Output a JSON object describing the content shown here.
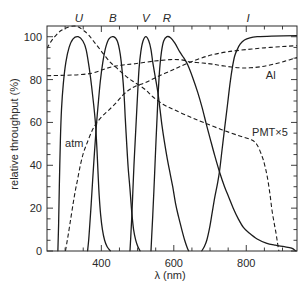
{
  "chart_data": {
    "type": "line",
    "title": "",
    "xlabel": "λ (nm)",
    "ylabel": "relative throughput (%)",
    "xlim": [
      250,
      940
    ],
    "ylim": [
      0,
      105
    ],
    "grid": false,
    "legend": "inline annotations",
    "xticks_major": [
      400,
      600,
      800
    ],
    "xticks_minor": [
      300,
      350,
      450,
      500,
      550,
      650,
      700,
      750,
      850,
      900
    ],
    "yticks_major": [
      0,
      20,
      40,
      60,
      80,
      100
    ],
    "yticks_minor": [
      5,
      10,
      15,
      25,
      30,
      35,
      45,
      50,
      55,
      65,
      70,
      75,
      85,
      90,
      95
    ],
    "band_labels": [
      {
        "label": "U",
        "x": 338
      },
      {
        "label": "B",
        "x": 432
      },
      {
        "label": "V",
        "x": 523
      },
      {
        "label": "R",
        "x": 581
      },
      {
        "label": "I",
        "x": 805
      }
    ],
    "annotations": [
      {
        "text": "atm",
        "x": 300,
        "y": 48.5
      },
      {
        "text": "Al",
        "x": 854,
        "y": 80.3
      },
      {
        "text": "PMT×5",
        "x": 816,
        "y": 53.7
      }
    ],
    "series": [
      {
        "name": "U",
        "style": "solid",
        "points": [
          [
            280,
            0
          ],
          [
            282,
            12
          ],
          [
            284,
            30
          ],
          [
            287,
            52
          ],
          [
            290,
            66
          ],
          [
            295,
            78
          ],
          [
            302,
            88
          ],
          [
            311,
            95
          ],
          [
            322,
            99
          ],
          [
            336,
            100
          ],
          [
            349,
            98
          ],
          [
            358,
            94
          ],
          [
            366,
            86
          ],
          [
            373,
            77
          ],
          [
            379,
            68
          ],
          [
            384,
            59
          ],
          [
            388,
            47
          ],
          [
            391,
            36
          ],
          [
            394,
            26
          ],
          [
            398,
            17
          ],
          [
            403,
            10
          ],
          [
            409,
            5
          ],
          [
            416,
            2
          ],
          [
            425,
            0
          ]
        ]
      },
      {
        "name": "B",
        "style": "solid",
        "points": [
          [
            362,
            0
          ],
          [
            365,
            5
          ],
          [
            368,
            12
          ],
          [
            372,
            22
          ],
          [
            376,
            33
          ],
          [
            381,
            46
          ],
          [
            386,
            58
          ],
          [
            391,
            68
          ],
          [
            397,
            79
          ],
          [
            404,
            88
          ],
          [
            412,
            95
          ],
          [
            421,
            99
          ],
          [
            433,
            100
          ],
          [
            444,
            98
          ],
          [
            452,
            92
          ],
          [
            458,
            83
          ],
          [
            463,
            72
          ],
          [
            466,
            62
          ],
          [
            470,
            50
          ],
          [
            474,
            39
          ],
          [
            479,
            29
          ],
          [
            484,
            18
          ],
          [
            489,
            10
          ],
          [
            495,
            5
          ],
          [
            501,
            2
          ],
          [
            507,
            0
          ]
        ]
      },
      {
        "name": "V",
        "style": "solid",
        "points": [
          [
            479,
            0
          ],
          [
            481,
            6
          ],
          [
            484,
            16
          ],
          [
            487,
            28
          ],
          [
            490,
            40
          ],
          [
            493,
            50
          ],
          [
            496,
            60
          ],
          [
            500,
            73
          ],
          [
            504,
            85
          ],
          [
            509,
            93
          ],
          [
            515,
            98
          ],
          [
            523,
            100
          ],
          [
            531,
            98
          ],
          [
            537,
            94
          ],
          [
            542,
            88
          ],
          [
            549,
            81
          ],
          [
            556,
            74
          ],
          [
            562,
            66
          ],
          [
            567,
            59
          ],
          [
            574,
            51
          ],
          [
            582,
            43
          ],
          [
            590,
            36
          ],
          [
            597,
            30
          ],
          [
            605,
            22
          ],
          [
            613,
            16
          ],
          [
            622,
            10
          ],
          [
            630,
            5
          ],
          [
            636,
            2
          ],
          [
            641,
            0
          ]
        ]
      },
      {
        "name": "R",
        "style": "solid",
        "points": [
          [
            537,
            0
          ],
          [
            539,
            7
          ],
          [
            542,
            17
          ],
          [
            545,
            28
          ],
          [
            548,
            40
          ],
          [
            551,
            52
          ],
          [
            554,
            63
          ],
          [
            557,
            74
          ],
          [
            561,
            85
          ],
          [
            566,
            93
          ],
          [
            572,
            98
          ],
          [
            581,
            100
          ],
          [
            591,
            99.5
          ],
          [
            603,
            97
          ],
          [
            616,
            93
          ],
          [
            628,
            90
          ],
          [
            638,
            87
          ],
          [
            652,
            81
          ],
          [
            666,
            74
          ],
          [
            678,
            67
          ],
          [
            690,
            59
          ],
          [
            701,
            52
          ],
          [
            713,
            44.5
          ],
          [
            726,
            37
          ],
          [
            740,
            30
          ],
          [
            752,
            25
          ],
          [
            764,
            20
          ],
          [
            778,
            15
          ],
          [
            792,
            11
          ],
          [
            808,
            8.4
          ],
          [
            830,
            5.6
          ],
          [
            855,
            3.7
          ],
          [
            880,
            2.7
          ],
          [
            905,
            2
          ],
          [
            925,
            1.3
          ],
          [
            937,
            0
          ]
        ]
      },
      {
        "name": "I",
        "style": "solid",
        "points": [
          [
            677,
            0
          ],
          [
            684,
            2
          ],
          [
            691,
            5
          ],
          [
            699,
            11
          ],
          [
            706,
            18
          ],
          [
            713,
            25
          ],
          [
            720,
            31
          ],
          [
            726,
            37
          ],
          [
            733,
            47
          ],
          [
            740,
            57
          ],
          [
            748,
            68
          ],
          [
            755,
            78
          ],
          [
            762,
            86
          ],
          [
            768,
            91
          ],
          [
            775,
            94
          ],
          [
            783,
            96.5
          ],
          [
            795,
            98.5
          ],
          [
            810,
            99.5
          ],
          [
            830,
            100
          ],
          [
            870,
            100.3
          ],
          [
            940,
            100.5
          ]
        ]
      },
      {
        "name": "atm",
        "style": "dashed",
        "points": [
          [
            301,
            0
          ],
          [
            305,
            4
          ],
          [
            309,
            8
          ],
          [
            315,
            14.5
          ],
          [
            322,
            22
          ],
          [
            328,
            28
          ],
          [
            334,
            33
          ],
          [
            342,
            40
          ],
          [
            351,
            46
          ],
          [
            362,
            51
          ],
          [
            374,
            56
          ],
          [
            384,
            59
          ],
          [
            400,
            62.5
          ],
          [
            419,
            65.5
          ],
          [
            440,
            69
          ],
          [
            458,
            72.5
          ],
          [
            475,
            75
          ],
          [
            493,
            76.8
          ],
          [
            520,
            78.5
          ],
          [
            545,
            80.5
          ],
          [
            570,
            82.5
          ],
          [
            595,
            84.3
          ],
          [
            616,
            86
          ],
          [
            644,
            88
          ],
          [
            675,
            90
          ],
          [
            707,
            91.6
          ],
          [
            750,
            93
          ],
          [
            800,
            94
          ],
          [
            850,
            94.8
          ],
          [
            900,
            95.4
          ],
          [
            940,
            95.8
          ]
        ]
      },
      {
        "name": "Al",
        "style": "dashed",
        "points": [
          [
            250,
            81.8
          ],
          [
            300,
            82
          ],
          [
            340,
            82.3
          ],
          [
            375,
            83
          ],
          [
            403,
            84.6
          ],
          [
            430,
            86
          ],
          [
            460,
            86.8
          ],
          [
            493,
            87.4
          ],
          [
            545,
            88.6
          ],
          [
            590,
            89.3
          ],
          [
            620,
            89.2
          ],
          [
            644,
            88.3
          ],
          [
            680,
            87.7
          ],
          [
            707,
            87.2
          ],
          [
            740,
            86.3
          ],
          [
            780,
            85.5
          ],
          [
            810,
            85.5
          ],
          [
            840,
            86
          ],
          [
            871,
            87
          ],
          [
            905,
            88.5
          ],
          [
            940,
            90.3
          ]
        ]
      },
      {
        "name": "PMT×5",
        "style": "dashed",
        "points": [
          [
            250,
            94.5
          ],
          [
            260,
            97.5
          ],
          [
            274,
            100.5
          ],
          [
            290,
            103
          ],
          [
            310,
            104.5
          ],
          [
            325,
            105
          ],
          [
            337,
            104.5
          ],
          [
            350,
            103
          ],
          [
            364,
            101
          ],
          [
            378,
            98
          ],
          [
            392,
            95
          ],
          [
            408,
            91.5
          ],
          [
            425,
            88
          ],
          [
            440,
            85.8
          ],
          [
            458,
            83
          ],
          [
            475,
            80.6
          ],
          [
            493,
            78.5
          ],
          [
            520,
            75.5
          ],
          [
            542,
            72
          ],
          [
            570,
            68.5
          ],
          [
            600,
            66
          ],
          [
            644,
            62.6
          ],
          [
            685,
            59.8
          ],
          [
            734,
            56.5
          ],
          [
            780,
            53.8
          ],
          [
            814,
            51.9
          ],
          [
            830,
            49.5
          ],
          [
            844,
            44
          ],
          [
            851,
            40
          ],
          [
            858,
            34.6
          ],
          [
            865,
            27
          ],
          [
            871,
            19
          ],
          [
            877,
            13
          ],
          [
            882,
            8.4
          ],
          [
            886,
            4
          ],
          [
            890,
            0
          ]
        ]
      }
    ]
  }
}
